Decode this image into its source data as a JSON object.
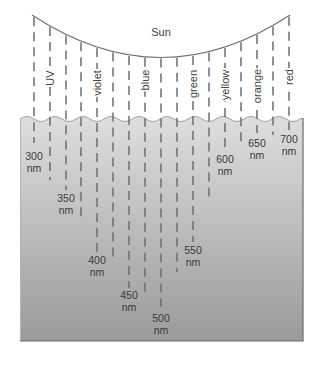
{
  "title": "Sun",
  "colors": {
    "line": "#6e6e6e",
    "curve": "#707070",
    "water_top": "#dcdcdc",
    "water_bottom": "#9c9c9c",
    "water_edge": "#6a6a6a",
    "text": "#444444"
  },
  "spectrum_labels": [
    {
      "text": "UV",
      "line_index": 1
    },
    {
      "text": "violet",
      "line_index": 4
    },
    {
      "text": "blue",
      "line_index": 7
    },
    {
      "text": "green",
      "line_index": 10
    },
    {
      "text": "yellow",
      "line_index": 12
    },
    {
      "text": "orange",
      "line_index": 14
    },
    {
      "text": "red",
      "line_index": 16
    }
  ],
  "depth_labels": [
    {
      "value": "300",
      "unit": "nm"
    },
    {
      "value": "350",
      "unit": "nm"
    },
    {
      "value": "400",
      "unit": "nm"
    },
    {
      "value": "450",
      "unit": "nm"
    },
    {
      "value": "500",
      "unit": "nm"
    },
    {
      "value": "550",
      "unit": "nm"
    },
    {
      "value": "600",
      "unit": "nm"
    },
    {
      "value": "650",
      "unit": "nm"
    },
    {
      "value": "700",
      "unit": "nm"
    }
  ],
  "rays": [
    {
      "x": 34,
      "end_y": 143
    },
    {
      "x": 50,
      "end_y": 180
    },
    {
      "x": 66,
      "end_y": 190
    },
    {
      "x": 81,
      "end_y": 222
    },
    {
      "x": 97,
      "end_y": 252
    },
    {
      "x": 113,
      "end_y": 262
    },
    {
      "x": 129,
      "end_y": 288
    },
    {
      "x": 145,
      "end_y": 292
    },
    {
      "x": 161,
      "end_y": 307
    },
    {
      "x": 177,
      "end_y": 272
    },
    {
      "x": 193,
      "end_y": 242
    },
    {
      "x": 209,
      "end_y": 202
    },
    {
      "x": 225,
      "end_y": 150
    },
    {
      "x": 241,
      "end_y": 142
    },
    {
      "x": 257,
      "end_y": 133
    },
    {
      "x": 273,
      "end_y": 135
    },
    {
      "x": 289,
      "end_y": 130
    }
  ]
}
